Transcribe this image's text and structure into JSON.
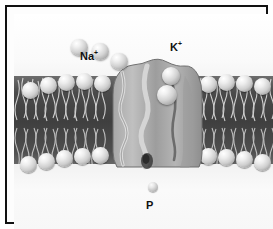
{
  "figure": {
    "frame_color": "#111111",
    "background_color": "#fbfbfb"
  },
  "regions": {
    "extracellular": {
      "name": "extracellular space"
    },
    "membrane": {
      "name": "phospholipid bilayer"
    },
    "cytoplasm": {
      "name": "cytoplasm"
    }
  },
  "labels": {
    "sodium": {
      "text": "Na",
      "charge": "+",
      "x": 66,
      "y": 36
    },
    "potassium": {
      "text": "K",
      "charge": "+",
      "x": 156,
      "y": 27
    },
    "phosphate": {
      "text": "P",
      "charge": "",
      "x": 132,
      "y": 186
    }
  },
  "ions": {
    "sodium": [
      {
        "x": 57,
        "y": 25,
        "d": 17
      },
      {
        "x": 78,
        "y": 29,
        "d": 17
      },
      {
        "x": 97,
        "y": 39,
        "d": 17
      }
    ],
    "potassium": [
      {
        "x": 148,
        "y": 53,
        "d": 18
      },
      {
        "x": 143,
        "y": 71,
        "d": 20
      }
    ],
    "phosphate": {
      "x": 134,
      "y": 168,
      "d": 10
    }
  },
  "membrane": {
    "color_core": "#434343",
    "head_color": "#d9d9d9",
    "upper_heads": [
      {
        "x": 8,
        "y": 68,
        "d": 17
      },
      {
        "x": 26,
        "y": 63,
        "d": 17
      },
      {
        "x": 44,
        "y": 60,
        "d": 17
      },
      {
        "x": 62,
        "y": 59,
        "d": 17
      },
      {
        "x": 80,
        "y": 61,
        "d": 17
      },
      {
        "x": 186,
        "y": 62,
        "d": 17
      },
      {
        "x": 204,
        "y": 60,
        "d": 17
      },
      {
        "x": 222,
        "y": 61,
        "d": 17
      },
      {
        "x": 240,
        "y": 64,
        "d": 17
      }
    ],
    "lower_heads": [
      {
        "x": 6,
        "y": 142,
        "d": 17
      },
      {
        "x": 24,
        "y": 139,
        "d": 17
      },
      {
        "x": 42,
        "y": 136,
        "d": 17
      },
      {
        "x": 60,
        "y": 134,
        "d": 17
      },
      {
        "x": 78,
        "y": 133,
        "d": 17
      },
      {
        "x": 186,
        "y": 134,
        "d": 17
      },
      {
        "x": 204,
        "y": 135,
        "d": 17
      },
      {
        "x": 222,
        "y": 137,
        "d": 17
      },
      {
        "x": 240,
        "y": 140,
        "d": 17
      }
    ],
    "tail_count_left": 18,
    "tail_count_right": 16
  },
  "protein": {
    "name": "transport protein",
    "fill_light": "#b9b9b9",
    "fill_mid": "#9a9a9a",
    "fill_dark": "#7d7d7d",
    "x": 83,
    "y": 44,
    "width": 110,
    "height": 117
  }
}
